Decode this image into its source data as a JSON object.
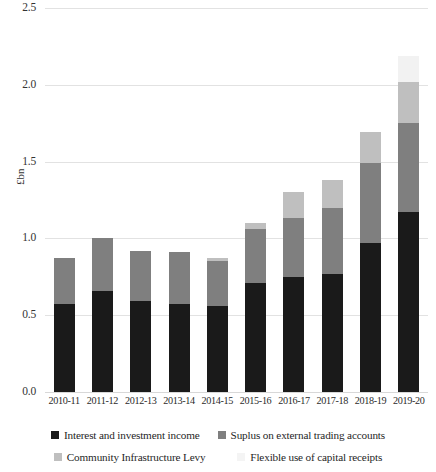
{
  "chart_data": {
    "type": "bar",
    "stacked": true,
    "title": "",
    "subtitle": "",
    "xlabel": "",
    "ylabel": "£bn",
    "ylim": [
      0,
      2.5
    ],
    "ytick_labels": [
      "0.0",
      "0.5",
      "1.0",
      "1.5",
      "2.0",
      "2.5"
    ],
    "ytick_values": [
      0,
      0.5,
      1.0,
      1.5,
      2.0,
      2.5
    ],
    "grid": true,
    "legend_position": "bottom",
    "categories": [
      "2010-11",
      "2011-12",
      "2012-13",
      "2013-14",
      "2014-15",
      "2015-16",
      "2016-17",
      "2017-18",
      "2018-19",
      "2019-20"
    ],
    "series": [
      {
        "name": "Interest and investment income",
        "color": "#1a1a1a",
        "values": [
          0.57,
          0.66,
          0.59,
          0.57,
          0.56,
          0.71,
          0.75,
          0.77,
          0.97,
          1.17
        ]
      },
      {
        "name": "Suplus on external trading accounts",
        "color": "#7f7f7f",
        "values": [
          0.3,
          0.34,
          0.33,
          0.34,
          0.29,
          0.35,
          0.38,
          0.43,
          0.52,
          0.58
        ]
      },
      {
        "name": "Community Infrastructure Levy",
        "color": "#bfbfbf",
        "values": [
          0.0,
          0.0,
          0.0,
          0.0,
          0.02,
          0.04,
          0.17,
          0.18,
          0.2,
          0.27
        ]
      },
      {
        "name": "Flexible use of capital receipts",
        "color": "#f2f2f2",
        "values": [
          0.0,
          0.0,
          0.0,
          0.0,
          0.0,
          0.0,
          0.0,
          0.0,
          0.0,
          0.17
        ]
      }
    ],
    "totals": [
      0.87,
      1.0,
      0.92,
      0.91,
      0.87,
      1.1,
      1.3,
      1.38,
      1.69,
      2.19
    ]
  },
  "legend": {
    "row1": [
      {
        "label": "Interest and investment income",
        "color": "#1a1a1a"
      },
      {
        "label": "Suplus on external trading accounts",
        "color": "#7f7f7f"
      }
    ],
    "row2": [
      {
        "label": "Community Infrastructure Levy",
        "color": "#bfbfbf"
      },
      {
        "label": "Flexible use of capital receipts",
        "color": "#f4f4f4"
      }
    ]
  },
  "axis": {
    "y_title": "£bn"
  }
}
